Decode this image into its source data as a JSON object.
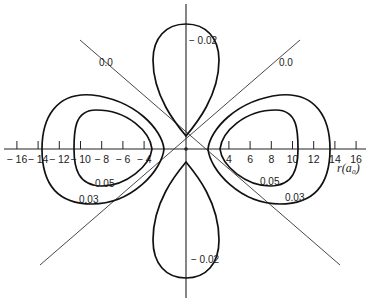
{
  "chart_data": {
    "type": "contour",
    "title": "",
    "xlabel": "r(a0)",
    "x_axis_label_display": "r(a₀)",
    "x_ticks": [
      -16,
      -14,
      -12,
      -10,
      -8,
      -6,
      -4,
      4,
      6,
      8,
      10,
      12,
      14,
      16
    ],
    "x_tick_labels": [
      "− 16",
      "− 14",
      "− 12",
      "− 10",
      "− 8",
      "− 6",
      "− 4",
      "4",
      "6",
      "8",
      "10",
      "12",
      "14",
      "16"
    ],
    "xlim": [
      -17,
      17
    ],
    "nodal_lines": [
      {
        "label": "0.0",
        "angle_deg": 45
      },
      {
        "label": "0.0",
        "angle_deg": 135
      }
    ],
    "contours": [
      {
        "label": "0.05",
        "lobe": "right",
        "r_min": 3.3,
        "r_max": 10.5
      },
      {
        "label": "0.03",
        "lobe": "right",
        "r_min": 2.0,
        "r_max": 13.5
      },
      {
        "label": "0.05",
        "lobe": "left",
        "r_min": -3.3,
        "r_max": -10.5
      },
      {
        "label": "0.03",
        "lobe": "left",
        "r_min": -2.0,
        "r_max": -13.5
      },
      {
        "label": "− 0.02",
        "lobe": "top",
        "y_max": 11.8
      },
      {
        "label": "− 0.02",
        "lobe": "bottom",
        "y_min": -12.2
      }
    ],
    "grid": false,
    "legend": "none"
  }
}
